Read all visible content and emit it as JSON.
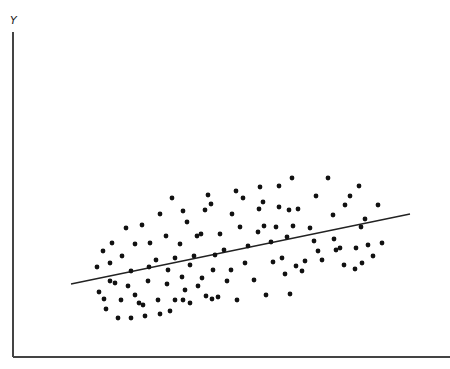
{
  "chart_data": {
    "type": "scatter",
    "title": "",
    "xlabel": "",
    "ylabel": "Y",
    "grid": false,
    "legend": null,
    "axes": {
      "x_axis_px": {
        "x1": 13,
        "y1": 357,
        "x2": 450,
        "y2": 357
      },
      "y_axis_px": {
        "x1": 13,
        "y1": 32,
        "x2": 13,
        "y2": 357
      }
    },
    "regression_line_px": {
      "x1": 71,
      "y1": 284,
      "x2": 410,
      "y2": 214
    },
    "points_px": [
      [
        97,
        267
      ],
      [
        99,
        292
      ],
      [
        103,
        251
      ],
      [
        104,
        299
      ],
      [
        106,
        309
      ],
      [
        110,
        281
      ],
      [
        110,
        263
      ],
      [
        112,
        243
      ],
      [
        115,
        283
      ],
      [
        118,
        318
      ],
      [
        121,
        300
      ],
      [
        122,
        256
      ],
      [
        126,
        228
      ],
      [
        128,
        286
      ],
      [
        131,
        318
      ],
      [
        131,
        271
      ],
      [
        135,
        244
      ],
      [
        135,
        295
      ],
      [
        139,
        303
      ],
      [
        142,
        225
      ],
      [
        143,
        305
      ],
      [
        145,
        316
      ],
      [
        148,
        281
      ],
      [
        149,
        267
      ],
      [
        150,
        243
      ],
      [
        156,
        260
      ],
      [
        158,
        300
      ],
      [
        160,
        214
      ],
      [
        160,
        314
      ],
      [
        166,
        236
      ],
      [
        167,
        284
      ],
      [
        168,
        270
      ],
      [
        170,
        311
      ],
      [
        172,
        198
      ],
      [
        175,
        258
      ],
      [
        175,
        300
      ],
      [
        180,
        244
      ],
      [
        182,
        277
      ],
      [
        183,
        211
      ],
      [
        183,
        300
      ],
      [
        185,
        290
      ],
      [
        187,
        222
      ],
      [
        190,
        303
      ],
      [
        190,
        265
      ],
      [
        194,
        256
      ],
      [
        197,
        236
      ],
      [
        198,
        286
      ],
      [
        201,
        234
      ],
      [
        202,
        278
      ],
      [
        205,
        210
      ],
      [
        206,
        296
      ],
      [
        208,
        195
      ],
      [
        211,
        204
      ],
      [
        212,
        299
      ],
      [
        213,
        270
      ],
      [
        215,
        255
      ],
      [
        218,
        297
      ],
      [
        220,
        234
      ],
      [
        224,
        250
      ],
      [
        227,
        281
      ],
      [
        231,
        270
      ],
      [
        232,
        214
      ],
      [
        236,
        191
      ],
      [
        237,
        300
      ],
      [
        240,
        227
      ],
      [
        243,
        198
      ],
      [
        245,
        263
      ],
      [
        248,
        246
      ],
      [
        254,
        280
      ],
      [
        258,
        232
      ],
      [
        259,
        209
      ],
      [
        260,
        187
      ],
      [
        263,
        202
      ],
      [
        264,
        226
      ],
      [
        266,
        295
      ],
      [
        271,
        242
      ],
      [
        273,
        262
      ],
      [
        276,
        227
      ],
      [
        279,
        207
      ],
      [
        279,
        186
      ],
      [
        282,
        258
      ],
      [
        285,
        274
      ],
      [
        287,
        237
      ],
      [
        289,
        210
      ],
      [
        290,
        294
      ],
      [
        292,
        178
      ],
      [
        293,
        226
      ],
      [
        296,
        266
      ],
      [
        298,
        209
      ],
      [
        302,
        271
      ],
      [
        305,
        261
      ],
      [
        310,
        228
      ],
      [
        314,
        241
      ],
      [
        316,
        196
      ],
      [
        318,
        251
      ],
      [
        322,
        260
      ],
      [
        328,
        178
      ],
      [
        333,
        215
      ],
      [
        334,
        239
      ],
      [
        336,
        250
      ],
      [
        340,
        248
      ],
      [
        345,
        205
      ],
      [
        350,
        196
      ],
      [
        355,
        269
      ],
      [
        359,
        186
      ],
      [
        361,
        227
      ],
      [
        362,
        263
      ],
      [
        365,
        219
      ],
      [
        368,
        245
      ],
      [
        378,
        205
      ],
      [
        344,
        265
      ],
      [
        356,
        248
      ],
      [
        373,
        256
      ],
      [
        382,
        243
      ]
    ]
  }
}
